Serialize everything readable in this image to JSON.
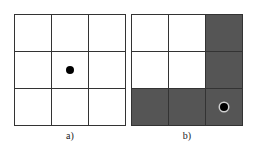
{
  "panels": [
    {
      "label": "a)",
      "rows": 3,
      "cols": 3,
      "cells": [
        {
          "shaded": false,
          "dot": false
        },
        {
          "shaded": false,
          "dot": false
        },
        {
          "shaded": false,
          "dot": false
        },
        {
          "shaded": false,
          "dot": false
        },
        {
          "shaded": false,
          "dot": true
        },
        {
          "shaded": false,
          "dot": false
        },
        {
          "shaded": false,
          "dot": false
        },
        {
          "shaded": false,
          "dot": false
        },
        {
          "shaded": false,
          "dot": false
        }
      ]
    },
    {
      "label": "b)",
      "rows": 3,
      "cols": 3,
      "cells": [
        {
          "shaded": false,
          "dot": false
        },
        {
          "shaded": false,
          "dot": false
        },
        {
          "shaded": true,
          "dot": false
        },
        {
          "shaded": false,
          "dot": false
        },
        {
          "shaded": false,
          "dot": false
        },
        {
          "shaded": true,
          "dot": false
        },
        {
          "shaded": true,
          "dot": false
        },
        {
          "shaded": true,
          "dot": false
        },
        {
          "shaded": true,
          "dot": true
        }
      ]
    }
  ],
  "colors": {
    "grid_line": "#333333",
    "shaded_cell": "#555555",
    "empty_cell": "#ffffff",
    "dot": "#000000"
  }
}
